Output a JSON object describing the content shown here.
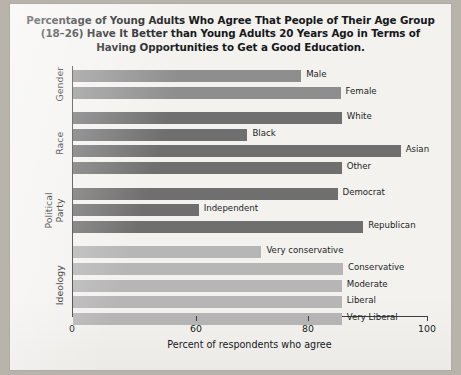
{
  "chart_data": {
    "type": "bar",
    "orientation": "horizontal",
    "title": "Percentage of Young Adults Who Agree That People of Their Age Group (18–26) Have It Better than Young Adults 20 Years Ago in Terms of Having Opportunities to Get a Good Education.",
    "title_lines": [
      "Percentage of Young Adults Who Agree That People of Their Age Group",
      "(18–26) Have It Better than Young Adults 20 Years Ago in Terms of",
      "Having Opportunities to Get a Good Education."
    ],
    "xlabel": "Percent of respondents who agree",
    "ylabel": "",
    "xlim": [
      0,
      100
    ],
    "xticks": [
      0,
      60,
      80,
      100
    ],
    "xtick_labels": [
      "0",
      "60",
      "80",
      "100"
    ],
    "axis_note": "broken axis: 0 to 60 compressed",
    "grid": false,
    "legend": "none",
    "groups": [
      {
        "name": "Gender",
        "color": "#8e8e8e",
        "categories": [
          "Male",
          "Female"
        ],
        "values": [
          78.6,
          85.3
        ]
      },
      {
        "name": "Race",
        "color": "#6f6f70",
        "categories": [
          "White",
          "Black",
          "Asian",
          "Other"
        ],
        "values": [
          85.5,
          69.0,
          95.4,
          85.5
        ]
      },
      {
        "name": "Political Party",
        "color": "#6f6f70",
        "categories": [
          "Democrat",
          "Independent",
          "Republican"
        ],
        "values": [
          84.8,
          60.3,
          89.1
        ]
      },
      {
        "name": "Ideology",
        "color": "#b6b6b6",
        "categories": [
          "Very conservative",
          "Conservative",
          "Moderate",
          "Liberal",
          "Very Liberal"
        ],
        "values": [
          71.5,
          85.7,
          85.5,
          85.5,
          85.5
        ]
      }
    ],
    "bars": [
      {
        "label": "Male",
        "value": 78.6,
        "group": "Gender",
        "color": "#8e8e8e"
      },
      {
        "label": "Female",
        "value": 85.3,
        "group": "Gender",
        "color": "#8e8e8e"
      },
      {
        "label": "White",
        "value": 85.5,
        "group": "Race",
        "color": "#6f6f70"
      },
      {
        "label": "Black",
        "value": 69.0,
        "group": "Race",
        "color": "#6f6f70"
      },
      {
        "label": "Asian",
        "value": 95.4,
        "group": "Race",
        "color": "#6f6f70"
      },
      {
        "label": "Other",
        "value": 85.5,
        "group": "Race",
        "color": "#6f6f70"
      },
      {
        "label": "Democrat",
        "value": 84.8,
        "group": "Political Party",
        "color": "#6f6f70"
      },
      {
        "label": "Independent",
        "value": 60.3,
        "group": "Political Party",
        "color": "#6f6f70"
      },
      {
        "label": "Republican",
        "value": 89.1,
        "group": "Political Party",
        "color": "#6f6f70"
      },
      {
        "label": "Very conservative",
        "value": 71.5,
        "group": "Ideology",
        "color": "#b6b6b6"
      },
      {
        "label": "Conservative",
        "value": 85.7,
        "group": "Ideology",
        "color": "#b6b6b6"
      },
      {
        "label": "Moderate",
        "value": 85.5,
        "group": "Ideology",
        "color": "#b6b6b6"
      },
      {
        "label": "Liberal",
        "value": 85.5,
        "group": "Ideology",
        "color": "#b6b6b6"
      },
      {
        "label": "Very Liberal",
        "value": 85.5,
        "group": "Ideology",
        "color": "#b6b6b6"
      }
    ]
  },
  "colors": {
    "gender_bar": "#8e8e8e",
    "race_bar": "#6f6f70",
    "party_bar": "#6f6f70",
    "ideology_bar": "#b6b6b6",
    "axis": "#3c3f42",
    "text": "#17191b",
    "page": "#f3f2ef",
    "backdrop": "#b8b4ac"
  }
}
